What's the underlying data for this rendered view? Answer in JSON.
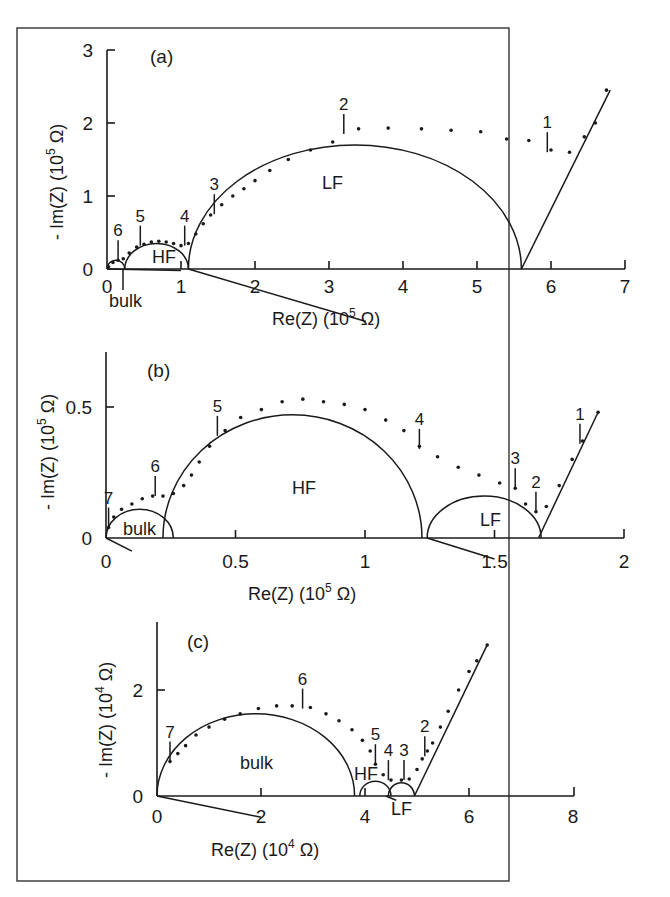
{
  "figure": {
    "border_color": "#333333"
  },
  "chart_data": [
    {
      "type": "scatter",
      "panel": "(a)",
      "xlabel": "Re(Z) (10^5 Ω)",
      "xlabel_main": "Re(Z) (10",
      "xlabel_exp": "5",
      "xlabel_unit": " Ω)",
      "ylabel": "- Im(Z) (10^5 Ω)",
      "ylabel_main": "- Im(Z) (10",
      "ylabel_exp": "5",
      "ylabel_unit": " Ω)",
      "xlim": [
        0,
        7
      ],
      "ylim": [
        0,
        3
      ],
      "xticks": [
        "0",
        "1",
        "2",
        "3",
        "4",
        "5",
        "6",
        "7"
      ],
      "yticks": [
        "0",
        "1",
        "2",
        "3"
      ],
      "grid": false,
      "regions": [
        {
          "name": "bulk",
          "x_start": 0,
          "x_end": 0.25
        },
        {
          "name": "HF",
          "x_start": 0.25,
          "x_end": 1.1
        },
        {
          "name": "LF",
          "x_start": 1.1,
          "x_end": 5.6
        }
      ],
      "fitted_arcs": [
        {
          "label": "bulk",
          "center_x": 0.12,
          "radius": 0.12
        },
        {
          "label": "HF",
          "center_x": 0.67,
          "radius": 0.43,
          "peak_y": 0.35
        },
        {
          "label": "LF",
          "center_x": 3.35,
          "radius": 2.25,
          "peak_y": 1.7
        }
      ],
      "spike": {
        "from": [
          5.6,
          0
        ],
        "to": [
          6.8,
          2.45
        ]
      },
      "frequency_markers": [
        {
          "label": "1",
          "x": 5.95,
          "y": 1.6
        },
        {
          "label": "2",
          "x": 3.2,
          "y": 1.85
        },
        {
          "label": "3",
          "x": 1.45,
          "y": 0.75
        },
        {
          "label": "4",
          "x": 1.05,
          "y": 0.32
        },
        {
          "label": "5",
          "x": 0.45,
          "y": 0.32
        },
        {
          "label": "6",
          "x": 0.15,
          "y": 0.12
        }
      ],
      "data_points": [
        [
          0.02,
          0.03
        ],
        [
          0.08,
          0.09
        ],
        [
          0.15,
          0.12
        ],
        [
          0.22,
          0.14
        ],
        [
          0.3,
          0.22
        ],
        [
          0.4,
          0.3
        ],
        [
          0.5,
          0.34
        ],
        [
          0.6,
          0.37
        ],
        [
          0.7,
          0.38
        ],
        [
          0.8,
          0.37
        ],
        [
          0.9,
          0.35
        ],
        [
          1.0,
          0.32
        ],
        [
          1.1,
          0.35
        ],
        [
          1.2,
          0.48
        ],
        [
          1.3,
          0.62
        ],
        [
          1.4,
          0.74
        ],
        [
          1.55,
          0.88
        ],
        [
          1.7,
          1.0
        ],
        [
          1.85,
          1.1
        ],
        [
          2.0,
          1.21
        ],
        [
          2.2,
          1.35
        ],
        [
          2.45,
          1.5
        ],
        [
          2.75,
          1.63
        ],
        [
          3.05,
          1.74
        ],
        [
          3.4,
          1.92
        ],
        [
          3.8,
          1.93
        ],
        [
          4.25,
          1.92
        ],
        [
          4.65,
          1.9
        ],
        [
          5.05,
          1.88
        ],
        [
          5.4,
          1.78
        ],
        [
          5.7,
          1.76
        ],
        [
          6.0,
          1.63
        ],
        [
          6.25,
          1.6
        ],
        [
          6.45,
          1.81
        ],
        [
          6.6,
          2.0
        ],
        [
          6.75,
          2.45
        ]
      ]
    },
    {
      "type": "scatter",
      "panel": "(b)",
      "xlabel": "Re(Z) (10^5 Ω)",
      "xlabel_main": "Re(Z) (10",
      "xlabel_exp": "5",
      "xlabel_unit": " Ω)",
      "ylabel": "- Im(Z) (10^5 Ω)",
      "ylabel_main": "- Im(Z) (10",
      "ylabel_exp": "5",
      "ylabel_unit": " Ω)",
      "xlim": [
        0,
        2
      ],
      "ylim": [
        0,
        0.65
      ],
      "xticks": [
        "0",
        "0.5",
        "1",
        "1.5",
        "2"
      ],
      "yticks": [
        "0",
        "0.5"
      ],
      "grid": false,
      "fitted_arcs": [
        {
          "label": "bulk",
          "center_x": 0.13,
          "radius": 0.13,
          "peak_y": 0.11
        },
        {
          "label": "HF",
          "center_x": 0.72,
          "radius": 0.5,
          "peak_y": 0.47
        },
        {
          "label": "LF",
          "center_x": 1.46,
          "radius": 0.22,
          "peak_y": 0.16
        }
      ],
      "spike": {
        "from": [
          1.67,
          0
        ],
        "to": [
          1.9,
          0.48
        ]
      },
      "frequency_markers": [
        {
          "label": "1",
          "x": 1.83,
          "y": 0.36
        },
        {
          "label": "2",
          "x": 1.66,
          "y": 0.1
        },
        {
          "label": "3",
          "x": 1.58,
          "y": 0.19
        },
        {
          "label": "4",
          "x": 1.21,
          "y": 0.34
        },
        {
          "label": "5",
          "x": 0.43,
          "y": 0.39
        },
        {
          "label": "6",
          "x": 0.19,
          "y": 0.16
        },
        {
          "label": "7",
          "x": 0.01,
          "y": 0.04
        }
      ],
      "data_points": [
        [
          0.01,
          0.04
        ],
        [
          0.03,
          0.08
        ],
        [
          0.06,
          0.11
        ],
        [
          0.1,
          0.13
        ],
        [
          0.14,
          0.15
        ],
        [
          0.18,
          0.16
        ],
        [
          0.22,
          0.16
        ],
        [
          0.26,
          0.17
        ],
        [
          0.3,
          0.2
        ],
        [
          0.33,
          0.24
        ],
        [
          0.36,
          0.29
        ],
        [
          0.4,
          0.35
        ],
        [
          0.46,
          0.41
        ],
        [
          0.52,
          0.46
        ],
        [
          0.6,
          0.49
        ],
        [
          0.68,
          0.52
        ],
        [
          0.76,
          0.53
        ],
        [
          0.84,
          0.52
        ],
        [
          0.92,
          0.51
        ],
        [
          1.0,
          0.49
        ],
        [
          1.08,
          0.45
        ],
        [
          1.15,
          0.41
        ],
        [
          1.21,
          0.35
        ],
        [
          1.28,
          0.31
        ],
        [
          1.36,
          0.27
        ],
        [
          1.44,
          0.24
        ],
        [
          1.52,
          0.21
        ],
        [
          1.58,
          0.19
        ],
        [
          1.62,
          0.13
        ],
        [
          1.66,
          0.1
        ],
        [
          1.7,
          0.12
        ],
        [
          1.75,
          0.2
        ],
        [
          1.8,
          0.3
        ],
        [
          1.84,
          0.37
        ],
        [
          1.9,
          0.48
        ]
      ]
    },
    {
      "type": "scatter",
      "panel": "(c)",
      "xlabel": "Re(Z) (10^4 Ω)",
      "xlabel_main": "Re(Z) (10",
      "xlabel_exp": "4",
      "xlabel_unit": " Ω)",
      "ylabel": "- Im(Z) (10^4 Ω)",
      "ylabel_main": "- Im(Z) (10",
      "ylabel_exp": "4",
      "ylabel_unit": " Ω)",
      "xlim": [
        0,
        8
      ],
      "ylim": [
        0,
        3
      ],
      "xticks": [
        "0",
        "2",
        "4",
        "6",
        "8"
      ],
      "yticks": [
        "0",
        "2"
      ],
      "grid": false,
      "fitted_arcs": [
        {
          "label": "bulk",
          "center_x": 1.9,
          "radius": 1.9,
          "peak_y": 1.55
        },
        {
          "label": "HF",
          "center_x": 4.2,
          "radius": 0.3,
          "peak_y": 0.28
        },
        {
          "label": "LF",
          "center_x": 4.7,
          "radius": 0.25,
          "peak_y": 0.25
        }
      ],
      "spike": {
        "from": [
          4.95,
          0
        ],
        "to": [
          6.35,
          2.85
        ]
      },
      "frequency_markers": [
        {
          "label": "2",
          "x": 5.15,
          "y": 0.75
        },
        {
          "label": "3",
          "x": 4.75,
          "y": 0.3
        },
        {
          "label": "4",
          "x": 4.45,
          "y": 0.3
        },
        {
          "label": "5",
          "x": 4.2,
          "y": 0.6
        },
        {
          "label": "6",
          "x": 2.8,
          "y": 1.65
        },
        {
          "label": "7",
          "x": 0.25,
          "y": 0.65
        }
      ],
      "data_points": [
        [
          0.25,
          0.65
        ],
        [
          0.4,
          0.8
        ],
        [
          0.55,
          0.95
        ],
        [
          0.75,
          1.15
        ],
        [
          1.0,
          1.3
        ],
        [
          1.3,
          1.45
        ],
        [
          1.6,
          1.55
        ],
        [
          1.95,
          1.65
        ],
        [
          2.3,
          1.7
        ],
        [
          2.6,
          1.7
        ],
        [
          2.95,
          1.67
        ],
        [
          3.25,
          1.55
        ],
        [
          3.5,
          1.42
        ],
        [
          3.75,
          1.25
        ],
        [
          3.95,
          1.05
        ],
        [
          4.1,
          0.85
        ],
        [
          4.2,
          0.6
        ],
        [
          4.35,
          0.4
        ],
        [
          4.5,
          0.3
        ],
        [
          4.7,
          0.3
        ],
        [
          4.85,
          0.32
        ],
        [
          5.0,
          0.5
        ],
        [
          5.1,
          0.7
        ],
        [
          5.2,
          0.85
        ],
        [
          5.3,
          1.0
        ],
        [
          5.45,
          1.3
        ],
        [
          5.6,
          1.6
        ],
        [
          5.8,
          2.0
        ],
        [
          6.0,
          2.35
        ],
        [
          6.15,
          2.55
        ],
        [
          6.35,
          2.85
        ]
      ]
    }
  ]
}
